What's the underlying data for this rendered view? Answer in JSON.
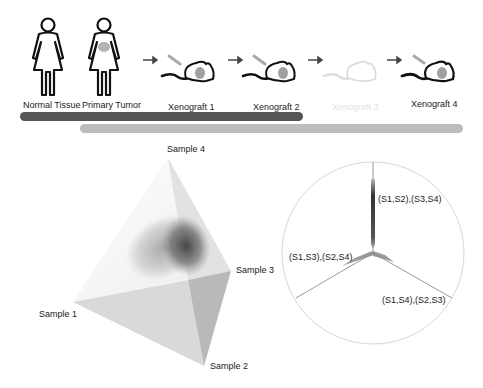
{
  "pipeline": {
    "stages": [
      {
        "label": "Normal Tissue",
        "icon": "woman-figure-icon",
        "faded": false
      },
      {
        "label": "Primary Tumor",
        "icon": "woman-figure-with-tumor-icon",
        "faded": false
      },
      {
        "label": "Xenograft 1",
        "icon": "mouse-with-tumor-icon",
        "faded": false
      },
      {
        "label": "Xenograft 2",
        "icon": "mouse-with-tumor-icon",
        "faded": false
      },
      {
        "label": "Xenograft 3",
        "icon": "mouse-faded-icon",
        "faded": true
      },
      {
        "label": "Xenograft 4",
        "icon": "mouse-with-tumor-icon",
        "faded": false
      }
    ],
    "bars": [
      {
        "name": "dark-range-bar",
        "color": "#555555"
      },
      {
        "name": "light-range-bar",
        "color": "#bdbdbd"
      }
    ]
  },
  "tetrahedron": {
    "vertex_labels": [
      "Sample 1",
      "Sample 2",
      "Sample 3",
      "Sample 4"
    ]
  },
  "tree_circle": {
    "branch_labels": [
      "(S1,S2),(S3,S4)",
      "(S1,S3),(S2,S4)",
      "(S1,S4),(S2,S3)"
    ]
  }
}
